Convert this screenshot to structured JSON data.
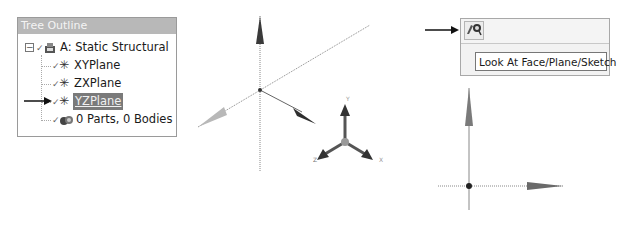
{
  "tree_outline": {
    "title": "Tree Outline",
    "items": [
      {
        "label": "A: Static Structural",
        "icon": "model-icon",
        "level": 0,
        "expanded": true,
        "selected": false
      },
      {
        "label": "XYPlane",
        "icon": "plane-icon",
        "level": 1,
        "selected": false
      },
      {
        "label": "ZXPlane",
        "icon": "plane-icon",
        "level": 1,
        "selected": false
      },
      {
        "label": "YZPlane",
        "icon": "plane-icon",
        "level": 1,
        "selected": true
      },
      {
        "label": "0 Parts, 0 Bodies",
        "icon": "parts-icon",
        "level": 1,
        "selected": false
      }
    ],
    "expander_glyph": "−",
    "check_glyph": "✓",
    "plane_glyph": "✳"
  },
  "toolbar": {
    "look_at_button_glyph": "look-at-icon",
    "tooltip": "Look At Face/Plane/Sketch"
  },
  "viewports": {
    "iso_view": {
      "triad_labels": {
        "x": "X",
        "y": "Y",
        "z": "Z"
      }
    },
    "plane_view": {}
  },
  "colors": {
    "header_bg": "#b8b8b8",
    "selection_bg": "#7a7a7a",
    "axis_dark": "#3a3a3a",
    "axis_light": "#b0b0b0"
  }
}
